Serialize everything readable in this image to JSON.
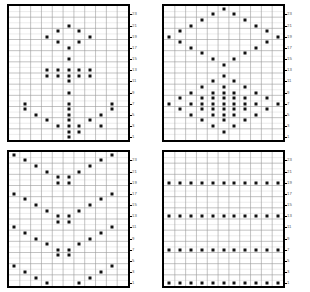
{
  "figure": {
    "title": "",
    "panel_count": 4,
    "grid_columns": 11,
    "grid_rows": 24,
    "dot_color": "#111111",
    "border_color": "#000000",
    "gridline_color": "#9a9a9a",
    "minor_gridline_color": "#cfcfcf",
    "background": "#ffffff"
  },
  "chart_data": [
    {
      "type": "scatter",
      "name": "panel-top-left",
      "title": "",
      "xlabel": "",
      "ylabel": "",
      "xlim": [
        0,
        11
      ],
      "ylim": [
        0,
        24
      ],
      "grid": true,
      "legend": null,
      "yticks": [
        23,
        21,
        19,
        17,
        15,
        13,
        11,
        9,
        7,
        5,
        3,
        1
      ],
      "xticks": [],
      "points": [
        [
          6,
          21
        ],
        [
          5,
          20
        ],
        [
          7,
          20
        ],
        [
          4,
          19
        ],
        [
          8,
          19
        ],
        [
          5,
          18
        ],
        [
          7,
          18
        ],
        [
          6,
          17
        ],
        [
          6,
          15
        ],
        [
          4,
          13
        ],
        [
          5,
          13
        ],
        [
          6,
          13
        ],
        [
          7,
          13
        ],
        [
          8,
          13
        ],
        [
          4,
          12
        ],
        [
          5,
          12
        ],
        [
          6,
          12
        ],
        [
          7,
          12
        ],
        [
          8,
          12
        ],
        [
          6,
          11
        ],
        [
          6,
          9
        ],
        [
          2,
          7
        ],
        [
          6,
          7
        ],
        [
          10,
          7
        ],
        [
          2,
          6
        ],
        [
          6,
          6
        ],
        [
          10,
          6
        ],
        [
          3,
          5
        ],
        [
          6,
          5
        ],
        [
          9,
          5
        ],
        [
          4,
          4
        ],
        [
          6,
          4
        ],
        [
          8,
          4
        ],
        [
          5,
          3
        ],
        [
          6,
          3
        ],
        [
          7,
          3
        ],
        [
          9,
          3
        ],
        [
          6,
          2
        ],
        [
          7,
          2
        ],
        [
          6,
          1
        ]
      ]
    },
    {
      "type": "scatter",
      "name": "panel-top-right",
      "title": "",
      "xlabel": "",
      "ylabel": "",
      "xlim": [
        0,
        11
      ],
      "ylim": [
        0,
        24
      ],
      "grid": true,
      "legend": null,
      "yticks": [
        23,
        21,
        19,
        17,
        15,
        13,
        11,
        9,
        7,
        5,
        3,
        1
      ],
      "xticks": [],
      "points": [
        [
          6,
          24
        ],
        [
          5,
          23
        ],
        [
          7,
          23
        ],
        [
          4,
          22
        ],
        [
          8,
          22
        ],
        [
          3,
          21
        ],
        [
          9,
          21
        ],
        [
          2,
          20
        ],
        [
          10,
          20
        ],
        [
          1,
          19
        ],
        [
          11,
          19
        ],
        [
          2,
          18
        ],
        [
          10,
          18
        ],
        [
          3,
          17
        ],
        [
          9,
          17
        ],
        [
          4,
          16
        ],
        [
          8,
          16
        ],
        [
          5,
          15
        ],
        [
          7,
          15
        ],
        [
          6,
          14
        ],
        [
          6,
          12
        ],
        [
          5,
          11
        ],
        [
          7,
          11
        ],
        [
          4,
          10
        ],
        [
          6,
          10
        ],
        [
          8,
          10
        ],
        [
          3,
          9
        ],
        [
          5,
          9
        ],
        [
          6,
          9
        ],
        [
          7,
          9
        ],
        [
          9,
          9
        ],
        [
          2,
          8
        ],
        [
          4,
          8
        ],
        [
          5,
          8
        ],
        [
          6,
          8
        ],
        [
          7,
          8
        ],
        [
          8,
          8
        ],
        [
          10,
          8
        ],
        [
          1,
          7
        ],
        [
          3,
          7
        ],
        [
          4,
          7
        ],
        [
          5,
          7
        ],
        [
          6,
          7
        ],
        [
          7,
          7
        ],
        [
          8,
          7
        ],
        [
          9,
          7
        ],
        [
          11,
          7
        ],
        [
          2,
          6
        ],
        [
          4,
          6
        ],
        [
          5,
          6
        ],
        [
          6,
          6
        ],
        [
          7,
          6
        ],
        [
          8,
          6
        ],
        [
          10,
          6
        ],
        [
          3,
          5
        ],
        [
          5,
          5
        ],
        [
          6,
          5
        ],
        [
          7,
          5
        ],
        [
          9,
          5
        ],
        [
          4,
          4
        ],
        [
          6,
          4
        ],
        [
          8,
          4
        ],
        [
          5,
          3
        ],
        [
          7,
          3
        ],
        [
          6,
          2
        ]
      ]
    },
    {
      "type": "scatter",
      "name": "panel-bottom-left",
      "title": "",
      "xlabel": "",
      "ylabel": "",
      "xlim": [
        0,
        11
      ],
      "ylim": [
        0,
        24
      ],
      "grid": true,
      "legend": null,
      "yticks": [
        23,
        21,
        19,
        17,
        15,
        13,
        11,
        9,
        7,
        5,
        3,
        1
      ],
      "xticks": [],
      "points": [
        [
          1,
          24
        ],
        [
          10,
          24
        ],
        [
          2,
          23
        ],
        [
          9,
          23
        ],
        [
          3,
          22
        ],
        [
          8,
          22
        ],
        [
          4,
          21
        ],
        [
          7,
          21
        ],
        [
          5,
          20
        ],
        [
          6,
          20
        ],
        [
          5,
          19
        ],
        [
          6,
          19
        ],
        [
          1,
          17
        ],
        [
          10,
          17
        ],
        [
          2,
          16
        ],
        [
          9,
          16
        ],
        [
          3,
          15
        ],
        [
          8,
          15
        ],
        [
          4,
          14
        ],
        [
          7,
          14
        ],
        [
          5,
          13
        ],
        [
          6,
          13
        ],
        [
          5,
          12
        ],
        [
          6,
          12
        ],
        [
          1,
          11
        ],
        [
          10,
          11
        ],
        [
          2,
          10
        ],
        [
          9,
          10
        ],
        [
          3,
          9
        ],
        [
          8,
          9
        ],
        [
          4,
          8
        ],
        [
          7,
          8
        ],
        [
          5,
          7
        ],
        [
          6,
          7
        ],
        [
          5,
          6
        ],
        [
          6,
          6
        ],
        [
          1,
          4
        ],
        [
          10,
          4
        ],
        [
          2,
          3
        ],
        [
          9,
          3
        ],
        [
          3,
          2
        ],
        [
          8,
          2
        ],
        [
          4,
          1
        ],
        [
          7,
          1
        ]
      ]
    },
    {
      "type": "scatter",
      "name": "panel-bottom-right",
      "title": "",
      "xlabel": "",
      "ylabel": "",
      "xlim": [
        0,
        11
      ],
      "ylim": [
        0,
        24
      ],
      "grid": true,
      "legend": null,
      "yticks": [
        23,
        21,
        19,
        17,
        15,
        13,
        11,
        9,
        7,
        5,
        3,
        1
      ],
      "xticks": [],
      "points": [
        [
          1,
          19
        ],
        [
          2,
          19
        ],
        [
          3,
          19
        ],
        [
          4,
          19
        ],
        [
          5,
          19
        ],
        [
          6,
          19
        ],
        [
          7,
          19
        ],
        [
          8,
          19
        ],
        [
          9,
          19
        ],
        [
          10,
          19
        ],
        [
          11,
          19
        ],
        [
          1,
          13
        ],
        [
          2,
          13
        ],
        [
          3,
          13
        ],
        [
          4,
          13
        ],
        [
          5,
          13
        ],
        [
          6,
          13
        ],
        [
          7,
          13
        ],
        [
          8,
          13
        ],
        [
          9,
          13
        ],
        [
          10,
          13
        ],
        [
          11,
          13
        ],
        [
          1,
          7
        ],
        [
          2,
          7
        ],
        [
          3,
          7
        ],
        [
          4,
          7
        ],
        [
          5,
          7
        ],
        [
          6,
          7
        ],
        [
          7,
          7
        ],
        [
          8,
          7
        ],
        [
          9,
          7
        ],
        [
          10,
          7
        ],
        [
          11,
          7
        ],
        [
          1,
          1
        ],
        [
          2,
          1
        ],
        [
          3,
          1
        ],
        [
          4,
          1
        ],
        [
          5,
          1
        ],
        [
          6,
          1
        ],
        [
          7,
          1
        ],
        [
          8,
          1
        ],
        [
          9,
          1
        ],
        [
          10,
          1
        ],
        [
          11,
          1
        ]
      ]
    }
  ]
}
